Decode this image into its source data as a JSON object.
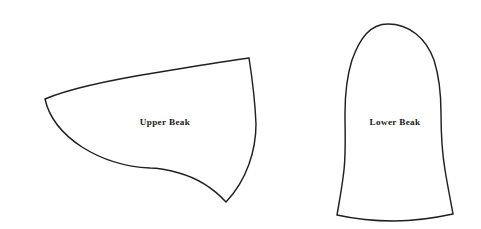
{
  "canvas": {
    "width": 481,
    "height": 229,
    "background_color": "#ffffff",
    "stroke_color": "#231f20",
    "label_color": "#1a1a1a"
  },
  "shapes": [
    {
      "id": "upper-beak",
      "label": "Upper Beak",
      "label_x": 165,
      "label_y": 123,
      "path": "M 45 99 C 73 87, 116 79, 160 72 C 196 66, 228 61, 249 58 C 252 77, 255 100, 256 124 C 256 150, 247 180, 226 202 C 213 188, 197 178, 179 173 C 165 169, 157 168, 150 168 C 128 167, 104 161, 82 147 C 62 134, 49 117, 45 99 Z"
    },
    {
      "id": "lower-beak",
      "label": "Lower Beak",
      "label_x": 395,
      "label_y": 123,
      "path": "M 388 24 C 409 24, 426 38, 434 60 C 439 76, 441 95, 441 113 C 441 134, 442 152, 445 170 C 448 188, 451 203, 453 214 C 430 219, 410 221, 394 221 C 375 221, 355 219, 337 215 C 339 203, 342 188, 344 170 C 346 152, 345 134, 345 113 C 345 95, 347 76, 352 60 C 360 38, 370 24, 388 24 Z"
    }
  ]
}
